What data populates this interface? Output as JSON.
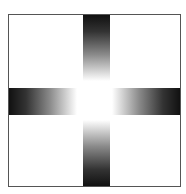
{
  "caption": {
    "text": ""
  },
  "figure": {
    "colors": {
      "border": "#555555",
      "dark": "#111111",
      "light": "#ffffff",
      "background": "#ffffff"
    },
    "arms": [
      {
        "name": "top",
        "direction": "dark-to-light downward"
      },
      {
        "name": "bottom",
        "direction": "dark-to-light upward"
      },
      {
        "name": "left",
        "direction": "dark-to-light rightward"
      },
      {
        "name": "right",
        "direction": "dark-to-light leftward"
      }
    ]
  }
}
